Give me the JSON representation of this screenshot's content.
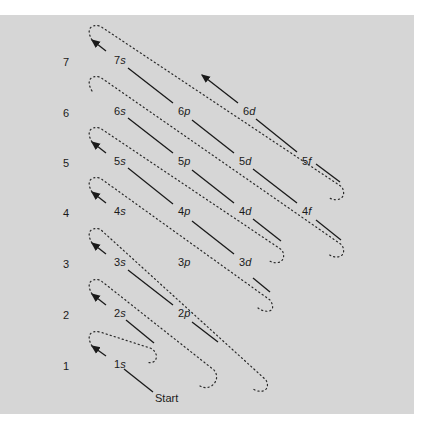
{
  "diagram": {
    "colors": {
      "background": "#d6d6d6",
      "ink": "#1a1a1a"
    },
    "start_label": "Start",
    "shells": [
      {
        "n": "1",
        "y": 366
      },
      {
        "n": "2",
        "y": 315
      },
      {
        "n": "3",
        "y": 264
      },
      {
        "n": "4",
        "y": 213
      },
      {
        "n": "5",
        "y": 163
      },
      {
        "n": "6",
        "y": 113
      },
      {
        "n": "7",
        "y": 62
      }
    ],
    "orbitals": [
      {
        "n": "1",
        "l": "s",
        "x": 114,
        "y": 358
      },
      {
        "n": "2",
        "l": "s",
        "x": 114,
        "y": 307
      },
      {
        "n": "2",
        "l": "p",
        "x": 178,
        "y": 307
      },
      {
        "n": "3",
        "l": "s",
        "x": 114,
        "y": 256
      },
      {
        "n": "3",
        "l": "p",
        "x": 178,
        "y": 256
      },
      {
        "n": "3",
        "l": "d",
        "x": 239,
        "y": 256
      },
      {
        "n": "4",
        "l": "s",
        "x": 114,
        "y": 205
      },
      {
        "n": "4",
        "l": "p",
        "x": 178,
        "y": 205
      },
      {
        "n": "4",
        "l": "d",
        "x": 239,
        "y": 205
      },
      {
        "n": "4",
        "l": "f",
        "x": 302,
        "y": 205
      },
      {
        "n": "5",
        "l": "s",
        "x": 114,
        "y": 155
      },
      {
        "n": "5",
        "l": "p",
        "x": 178,
        "y": 155
      },
      {
        "n": "5",
        "l": "d",
        "x": 239,
        "y": 155
      },
      {
        "n": "5",
        "l": "f",
        "x": 302,
        "y": 155
      },
      {
        "n": "6",
        "l": "s",
        "x": 114,
        "y": 105
      },
      {
        "n": "6",
        "l": "p",
        "x": 178,
        "y": 105
      },
      {
        "n": "6",
        "l": "d",
        "x": 243,
        "y": 105
      },
      {
        "n": "7",
        "l": "s",
        "x": 114,
        "y": 54
      }
    ],
    "filling_order": [
      "1s",
      "2s",
      "2p",
      "3s",
      "3p",
      "4s",
      "3d",
      "4p",
      "5s",
      "4d",
      "5p",
      "6s",
      "4f",
      "5d",
      "6p",
      "7s",
      "5f",
      "6d"
    ]
  }
}
